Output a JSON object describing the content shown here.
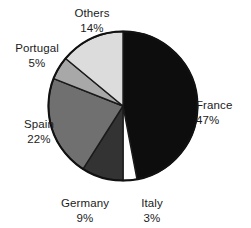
{
  "chart_data": {
    "type": "pie",
    "title": "",
    "subtitle": "",
    "xlabel": "",
    "ylabel": "",
    "legend_position": "none",
    "grid": false,
    "label_format": "name above percent, external callouts",
    "start_angle_deg": 0,
    "direction": "clockwise",
    "units": "percent",
    "total": 100,
    "categories": [
      "France",
      "Italy",
      "Germany",
      "Spain",
      "Portugal",
      "Others"
    ],
    "values": [
      47,
      3,
      9,
      22,
      5,
      14
    ],
    "slices": [
      {
        "label": "France",
        "value": 47,
        "percent_text": "47%",
        "color": "#0d0d0d"
      },
      {
        "label": "Italy",
        "value": 3,
        "percent_text": "3%",
        "color": "#ffffff"
      },
      {
        "label": "Germany",
        "value": 9,
        "percent_text": "9%",
        "color": "#333333"
      },
      {
        "label": "Spain",
        "value": 22,
        "percent_text": "22%",
        "color": "#707070"
      },
      {
        "label": "Portugal",
        "value": 5,
        "percent_text": "5%",
        "color": "#a8a8a8"
      },
      {
        "label": "Others",
        "value": 14,
        "percent_text": "14%",
        "color": "#dcdcdc"
      }
    ]
  },
  "labels": {
    "france": {
      "name": "France",
      "percent": "47%"
    },
    "italy": {
      "name": "Italy",
      "percent": "3%"
    },
    "germany": {
      "name": "Germany",
      "percent": "9%"
    },
    "spain": {
      "name": "Spain",
      "percent": "22%"
    },
    "portugal": {
      "name": "Portugal",
      "percent": "5%"
    },
    "others": {
      "name": "Others",
      "percent": "14%"
    }
  },
  "colors": {
    "background": "#ffffff",
    "text": "#1b1b1b",
    "outline": "#111111"
  }
}
